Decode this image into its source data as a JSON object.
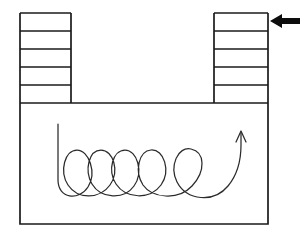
{
  "figure": {
    "background_color": "#ffffff",
    "line_color": "#1a1a1a",
    "coil_color": "#2b2b2b",
    "arrow_color": "#0d0d0d",
    "canvas": {
      "width": 307,
      "height": 240
    }
  },
  "vessel": {
    "name": "u-shaped-vessel",
    "outline_points": "20,13 20,103 20,224 268,224 268,103 268,13",
    "basin": {
      "left": 20,
      "right": 268,
      "top": 103,
      "bottom": 224
    }
  },
  "left_column": {
    "name": "left-graduated-column",
    "left": 20,
    "right": 71,
    "top": 13,
    "bottom": 103,
    "band_count": 5,
    "divider_y_values": [
      31,
      49,
      67,
      85
    ]
  },
  "right_column": {
    "name": "right-graduated-column",
    "left": 214,
    "right": 268,
    "top": 13,
    "bottom": 103,
    "band_count": 5,
    "divider_y_values": [
      31,
      49,
      67,
      85
    ]
  },
  "coil": {
    "name": "helical-coil",
    "loop_count": 4,
    "start_point": [
      58,
      124
    ],
    "end_point": [
      242,
      133
    ],
    "path": "M58,124 L58,180 C58,199 79,201 88,187 C97,173 89,150 77,150 C65,150 59,171 68,185 C78,200 100,199 110,185 C120,171 113,150 101,150 C89,150 84,170 92,184 C101,199 124,200 134,186 C144,172 137,150 125,150 C113,150 107,170 116,184 C126,199 150,200 161,185 C171,171 164,149 151,150 C139,151 134,171 143,185 C152,198 178,201 192,186 C206,171 205,152 191,149 C178,146 169,166 177,182 C187,201 214,203 228,186 C238,174 241,158 241,145 L241,133",
    "arrowhead": {
      "name": "coil-arrowhead-up",
      "path": "M236,142 L241,131 L246,142"
    }
  },
  "pointer_arrow": {
    "name": "left-pointing-arrow",
    "direction": "left",
    "target": "right-graduated-column top band",
    "tail_start": [
      300,
      21
    ],
    "tip": [
      270,
      21
    ],
    "polygon": "270,21 282,14 282,18 300,18 300,24 282,24 282,28"
  }
}
